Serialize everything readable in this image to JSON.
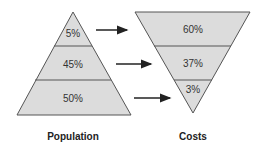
{
  "diagram": {
    "left_pyramid": {
      "caption": "Population",
      "segments": [
        "5%",
        "45%",
        "50%"
      ]
    },
    "right_pyramid": {
      "caption": "Costs",
      "segments": [
        "60%",
        "37%",
        "3%"
      ]
    },
    "colors": {
      "fill": "#dcdcdc",
      "stroke": "#555555",
      "arrow": "#222222"
    }
  }
}
